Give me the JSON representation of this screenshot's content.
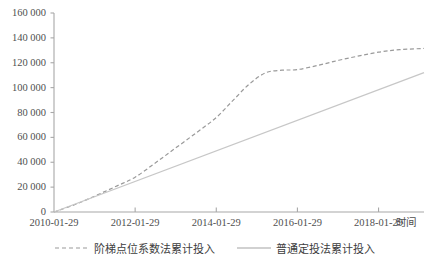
{
  "chart_data": {
    "type": "line",
    "title": "",
    "xlabel": "时间",
    "ylabel": "",
    "grid": false,
    "legend_position": "bottom",
    "ylim": [
      0,
      160000
    ],
    "ytick_labels": [
      "160 000",
      "140 000",
      "120 000",
      "100 000",
      "80 000",
      "60 000",
      "40 000",
      "20 000",
      "0"
    ],
    "ytick_values": [
      160000,
      140000,
      120000,
      100000,
      80000,
      60000,
      40000,
      20000,
      0
    ],
    "xtick_labels": [
      "2010-01-29",
      "2012-01-29",
      "2014-01-29",
      "2016-01-29",
      "2018-01-29"
    ],
    "xtick_values": [
      2010.08,
      2012.08,
      2014.08,
      2016.08,
      2018.08
    ],
    "xlim": [
      2010.08,
      2019.2
    ],
    "series": [
      {
        "name": "阶梯点位系数法累计投入",
        "style": "dashed",
        "color": "#9a9a9a",
        "x": [
          2010.08,
          2010.6,
          2011.1,
          2011.6,
          2012.08,
          2012.6,
          2013.1,
          2013.6,
          2014.08,
          2014.5,
          2014.9,
          2015.3,
          2015.7,
          2016.08,
          2016.6,
          2017.1,
          2017.6,
          2018.08,
          2018.6,
          2019.2
        ],
        "values": [
          0,
          6000,
          13000,
          20500,
          28000,
          40000,
          52000,
          64000,
          76000,
          90000,
          103000,
          112000,
          114000,
          114500,
          118000,
          122000,
          125500,
          128500,
          130500,
          131500
        ]
      },
      {
        "name": "普通定投法累计投入",
        "style": "solid",
        "color": "#c7c7c7",
        "x": [
          2010.08,
          2019.2
        ],
        "values": [
          0,
          112000
        ]
      }
    ]
  },
  "legend": {
    "items": [
      {
        "label": "阶梯点位系数法累计投入",
        "style": "dashed",
        "color": "#9a9a9a"
      },
      {
        "label": "普通定投法累计投入",
        "style": "solid",
        "color": "#c7c7c7"
      }
    ]
  },
  "axis": {
    "x_axis_name": "时间",
    "color": "#9e9e9e"
  }
}
